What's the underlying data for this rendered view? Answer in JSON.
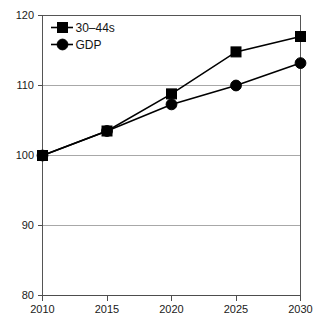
{
  "chart_data": {
    "type": "line",
    "title": "",
    "subtitle": "",
    "xlabel": "",
    "ylabel": "",
    "categories": [
      "2010",
      "2015",
      "2020",
      "2025",
      "2030"
    ],
    "x": [
      2010,
      2015,
      2020,
      2025,
      2030
    ],
    "series": [
      {
        "name": "30–44s",
        "marker": "square",
        "color": "#000000",
        "values": [
          100,
          103.5,
          108.8,
          114.8,
          117
        ]
      },
      {
        "name": "GDP",
        "marker": "circle",
        "color": "#000000",
        "values": [
          100,
          103.5,
          107.3,
          110,
          113.2
        ]
      }
    ],
    "ylim": [
      80,
      120
    ],
    "yticks": [
      80,
      90,
      100,
      110,
      120
    ],
    "ytick_labels": [
      "80",
      "90",
      "100",
      "110",
      "120"
    ],
    "xtick_labels": [
      "2010",
      "2015",
      "2020",
      "2025",
      "2030"
    ],
    "grid": true,
    "grid_axis": "y",
    "legend_position": "top-left",
    "legend": [
      "30–44s",
      "GDP"
    ]
  },
  "axes": {
    "y": {
      "ticks": [
        {
          "label": "120",
          "value": 120
        },
        {
          "label": "110",
          "value": 110
        },
        {
          "label": "100",
          "value": 100
        },
        {
          "label": "90",
          "value": 90
        },
        {
          "label": "80",
          "value": 80
        }
      ]
    },
    "x": {
      "ticks": [
        {
          "label": "2010",
          "value": 2010
        },
        {
          "label": "2015",
          "value": 2015
        },
        {
          "label": "2020",
          "value": 2020
        },
        {
          "label": "2025",
          "value": 2025
        },
        {
          "label": "2030",
          "value": 2030
        }
      ]
    }
  },
  "legend": {
    "items": [
      {
        "label": "30–44s",
        "marker": "square"
      },
      {
        "label": "GDP",
        "marker": "circle"
      }
    ]
  },
  "colors": {
    "series": "#000000",
    "grid": "#a8a8a8",
    "axis": "#4d4d4d",
    "background": "#ffffff",
    "text": "#1a1a1a"
  }
}
